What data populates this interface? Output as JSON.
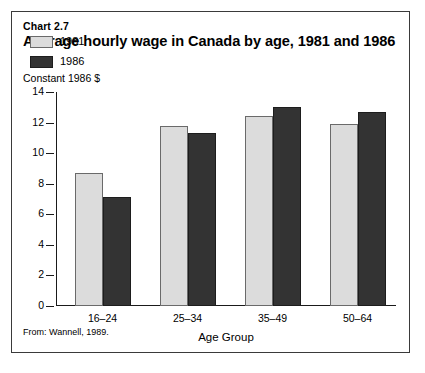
{
  "figure": {
    "chart_number": "Chart 2.7",
    "title": "Average hourly wage in Canada by age, 1981 and 1986",
    "units_label": "Constant 1986 $",
    "source": "From: Wannell, 1989."
  },
  "chart_data": {
    "type": "bar",
    "title": "Average hourly wage in Canada by age, 1981 and 1986",
    "subtitle": "Chart 2.7",
    "xlabel": "Age Group",
    "ylabel": "Constant 1986 $",
    "ylim": [
      0,
      14
    ],
    "yticks": [
      0,
      2,
      4,
      6,
      8,
      10,
      12,
      14
    ],
    "ytick_labels": [
      "0",
      "2",
      "4",
      "6",
      "8",
      "10",
      "12",
      "14"
    ],
    "grid": false,
    "legend_position": "upper-left",
    "categories": [
      "16–24",
      "25–34",
      "35–49",
      "50–64"
    ],
    "series": [
      {
        "name": "1981",
        "color": "#dcdcdc",
        "values": [
          8.7,
          11.8,
          12.4,
          11.9
        ]
      },
      {
        "name": "1986",
        "color": "#333333",
        "values": [
          7.1,
          11.3,
          13.0,
          12.7
        ]
      }
    ]
  }
}
